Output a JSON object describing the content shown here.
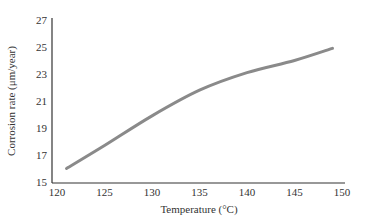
{
  "chart_data": {
    "type": "line",
    "title": "",
    "xlabel": "Temperature (°C)",
    "ylabel": "Corrosion rate (μm/year)",
    "xlim": [
      120,
      150
    ],
    "ylim": [
      15,
      27
    ],
    "xticks": [
      120,
      125,
      130,
      135,
      140,
      145,
      150
    ],
    "yticks": [
      15,
      17,
      19,
      21,
      23,
      25,
      27
    ],
    "grid": false,
    "legend": null,
    "series": [
      {
        "name": "Corrosion rate",
        "color": "#8a8a8a",
        "x": [
          121,
          125,
          130,
          135,
          140,
          145,
          149
        ],
        "y": [
          16.0,
          17.7,
          19.9,
          21.8,
          23.1,
          24.0,
          24.9
        ]
      }
    ]
  }
}
